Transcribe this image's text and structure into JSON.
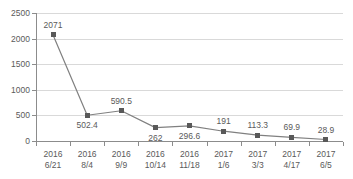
{
  "chart_data": {
    "type": "line",
    "title": "",
    "subtitle": "",
    "xlabel": "",
    "ylabel": "",
    "ylim": [
      0,
      2500
    ],
    "yticks": [
      0,
      500,
      1000,
      1500,
      2000,
      2500
    ],
    "ytick_labels": [
      "0",
      "500",
      "1000",
      "1500",
      "2000",
      "2500"
    ],
    "grid": true,
    "grid_axis": "y",
    "legend": false,
    "legend_position": "none",
    "marker": "square",
    "categories": [
      "2016 6/21",
      "2016 8/4",
      "2016 9/9",
      "2016 10/14",
      "2016 11/18",
      "2017 1/6",
      "2017 3/3",
      "2017 4/17",
      "2017 6/5"
    ],
    "category_lines": [
      {
        "year": "2016",
        "date": "6/21"
      },
      {
        "year": "2016",
        "date": "8/4"
      },
      {
        "year": "2016",
        "date": "9/9"
      },
      {
        "year": "2016",
        "date": "10/14"
      },
      {
        "year": "2016",
        "date": "11/18"
      },
      {
        "year": "2017",
        "date": "1/6"
      },
      {
        "year": "2017",
        "date": "3/3"
      },
      {
        "year": "2017",
        "date": "4/17"
      },
      {
        "year": "2017",
        "date": "6/5"
      }
    ],
    "values": [
      2071,
      502.4,
      590.5,
      262,
      296.6,
      191,
      113.3,
      69.9,
      28.9
    ],
    "data_labels": [
      "2071",
      "502.4",
      "590.5",
      "262",
      "296.6",
      "191",
      "113.3",
      "69.9",
      "28.9"
    ],
    "label_positions": [
      "above",
      "below",
      "above",
      "below",
      "below",
      "above",
      "above",
      "above",
      "above"
    ],
    "colors": {
      "line": "#808080",
      "marker": "#595959",
      "grid": "#d9d9d9",
      "axis": "#8c8c8c",
      "text": "#5a5a5a",
      "background": "#ffffff"
    }
  }
}
